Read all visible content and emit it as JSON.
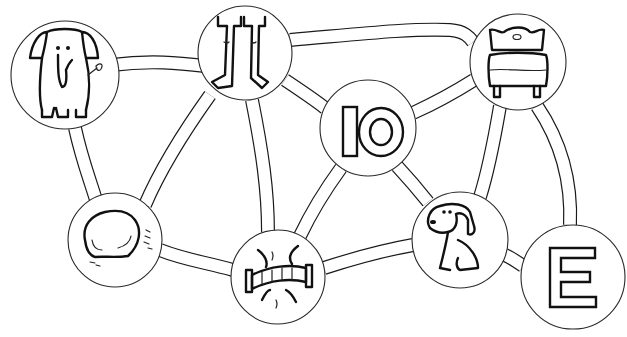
{
  "diagram": {
    "type": "path-network-activity-sheet",
    "nodes": [
      {
        "id": "elephant",
        "picture": "elephant",
        "label": "",
        "cx": 65,
        "cy": 75,
        "r": 55
      },
      {
        "id": "legs",
        "picture": "legs",
        "label": "",
        "cx": 245,
        "cy": 53,
        "r": 47
      },
      {
        "id": "ten",
        "picture": "number",
        "label": "10",
        "cx": 368,
        "cy": 128,
        "r": 48
      },
      {
        "id": "bed",
        "picture": "bed",
        "label": "",
        "cx": 518,
        "cy": 62,
        "r": 48
      },
      {
        "id": "rock",
        "picture": "rock",
        "label": "",
        "cx": 115,
        "cy": 240,
        "r": 47
      },
      {
        "id": "bridge",
        "picture": "bridge",
        "label": "",
        "cx": 278,
        "cy": 277,
        "r": 47
      },
      {
        "id": "dog",
        "picture": "dog",
        "label": "",
        "cx": 460,
        "cy": 240,
        "r": 48
      },
      {
        "id": "e",
        "picture": "letter",
        "label": "E",
        "cx": 573,
        "cy": 277,
        "r": 52
      }
    ],
    "edges": [
      [
        "elephant",
        "legs"
      ],
      [
        "elephant",
        "rock"
      ],
      [
        "legs",
        "rock"
      ],
      [
        "legs",
        "bridge"
      ],
      [
        "legs",
        "ten"
      ],
      [
        "legs",
        "bed"
      ],
      [
        "ten",
        "bed"
      ],
      [
        "ten",
        "bridge"
      ],
      [
        "ten",
        "dog"
      ],
      [
        "rock",
        "bridge"
      ],
      [
        "bridge",
        "dog"
      ],
      [
        "bed",
        "dog"
      ],
      [
        "bed",
        "e"
      ],
      [
        "dog",
        "e"
      ]
    ],
    "colors": {
      "line": "#1a1a1a",
      "background": "#ffffff"
    }
  }
}
